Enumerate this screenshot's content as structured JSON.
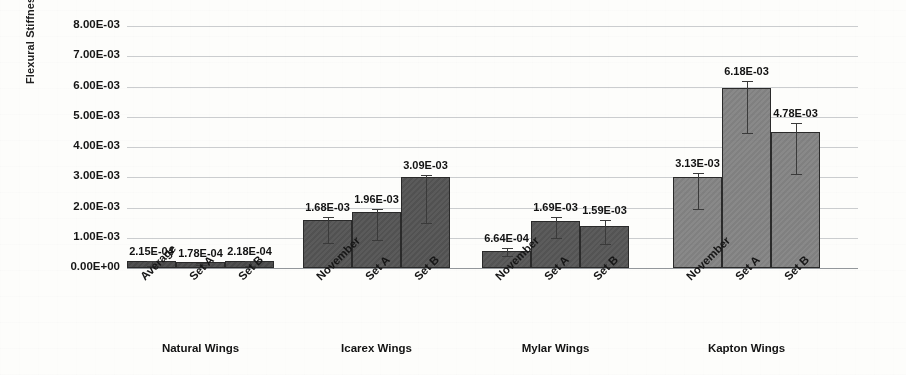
{
  "chart_data": {
    "type": "bar",
    "title": "",
    "xlabel": "",
    "ylabel": "Flexural Stiffness (N-m^2)",
    "ylim": [
      0,
      0.008
    ],
    "ytick_labels": [
      "8.00E-03",
      "7.00E-03",
      "6.00E-03",
      "5.00E-03",
      "4.00E-03",
      "3.00E-03",
      "2.00E-03",
      "1.00E-03",
      "0.00E+00"
    ],
    "ytick_values": [
      0.008,
      0.007,
      0.006,
      0.005,
      0.004,
      0.003,
      0.002,
      0.001,
      0
    ],
    "grid": true,
    "legend": "none",
    "groups": [
      {
        "name": "Natural Wings",
        "bar_color": "#4a4a4a",
        "categories": [
          "Average",
          "Set A",
          "Set B"
        ],
        "labels": [
          "2.15E-04",
          "1.78E-04",
          "2.18E-04"
        ],
        "values": [
          0.000215,
          0.000178,
          0.000218
        ],
        "bar_tops": [
          0.00022,
          0.0002,
          0.00022
        ],
        "err_low": [
          6e-05,
          9e-05,
          8e-05
        ]
      },
      {
        "name": "Icarex Wings",
        "bar_color": "#545454",
        "categories": [
          "November",
          "Set A",
          "Set B"
        ],
        "labels": [
          "1.68E-03",
          "1.96E-03",
          "3.09E-03"
        ],
        "values": [
          0.00168,
          0.00196,
          0.00309
        ],
        "bar_tops": [
          0.0016,
          0.00185,
          0.003
        ],
        "err_low": [
          0.00084,
          0.00092,
          0.0015
        ]
      },
      {
        "name": "Mylar Wings",
        "bar_color": "#565656",
        "categories": [
          "November",
          "Set A",
          "Set B"
        ],
        "labels": [
          "6.64E-04",
          "1.69E-03",
          "1.59E-03"
        ],
        "values": [
          0.000664,
          0.00169,
          0.00159
        ],
        "bar_tops": [
          0.00055,
          0.00155,
          0.0014
        ],
        "err_low": [
          0.0004,
          0.00098,
          0.0008
        ]
      },
      {
        "name": "Kapton Wings",
        "bar_color": "#848484",
        "categories": [
          "November",
          "Set A",
          "Set B"
        ],
        "labels": [
          "3.13E-03",
          "6.18E-03",
          "4.78E-03"
        ],
        "values": [
          0.00313,
          0.00618,
          0.00478
        ],
        "bar_tops": [
          0.003,
          0.00595,
          0.0045
        ],
        "err_low": [
          0.00195,
          0.00445,
          0.0031
        ]
      }
    ]
  }
}
